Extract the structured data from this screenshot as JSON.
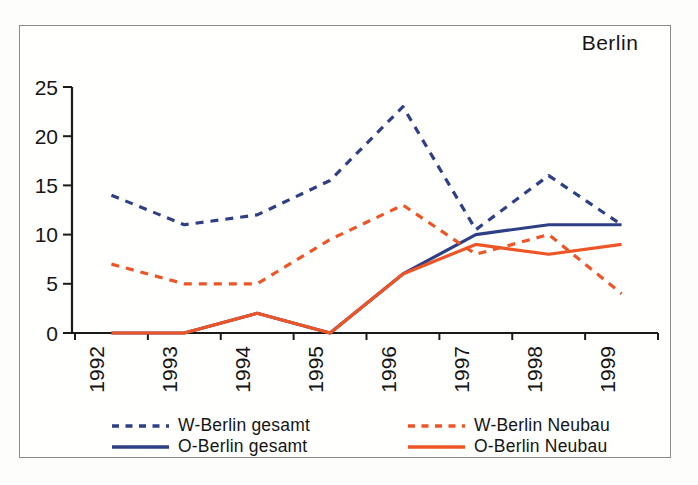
{
  "title": "Berlin",
  "colors": {
    "blue": "#2e3f85",
    "orange": "#ee5526",
    "axis": "#1a1a1a",
    "frame_border": "#8a8a8a",
    "background": "#ffffff"
  },
  "chart_data": {
    "type": "line",
    "title": "Berlin",
    "categories": [
      "1992",
      "1993",
      "1994",
      "1995",
      "1996",
      "1997",
      "1998",
      "1999"
    ],
    "series": [
      {
        "name": "O-Berlin gesamt",
        "color_key": "blue",
        "line_style": "solid",
        "values": [
          0,
          0,
          2,
          0,
          6,
          10,
          11,
          11
        ]
      },
      {
        "name": "O-Berlin Neubau",
        "color_key": "orange",
        "line_style": "solid",
        "values": [
          0,
          0,
          2,
          0,
          6,
          9,
          8,
          9
        ]
      },
      {
        "name": "W-Berlin gesamt",
        "color_key": "blue",
        "line_style": "dashed",
        "values": [
          14,
          11,
          12,
          15.5,
          23,
          10.5,
          16,
          11
        ]
      },
      {
        "name": "W-Berlin Neubau",
        "color_key": "orange",
        "line_style": "dashed",
        "values": [
          7,
          5,
          5,
          9.5,
          13,
          8,
          10,
          4
        ]
      }
    ],
    "xlabel": "",
    "ylabel": "",
    "ylim": [
      0,
      25
    ],
    "y_ticks": [
      0,
      5,
      10,
      15,
      20,
      25
    ],
    "grid": false,
    "legend_position": "bottom"
  },
  "legend": {
    "items": [
      {
        "label": "W-Berlin gesamt",
        "style": "dashed",
        "color_key": "blue"
      },
      {
        "label": "W-Berlin Neubau",
        "style": "dashed",
        "color_key": "orange"
      },
      {
        "label": "O-Berlin gesamt",
        "style": "solid",
        "color_key": "blue"
      },
      {
        "label": "O-Berlin Neubau",
        "style": "solid",
        "color_key": "orange"
      }
    ]
  }
}
